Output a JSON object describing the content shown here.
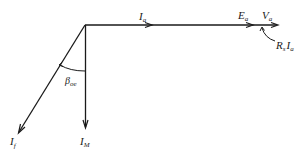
{
  "diagram": {
    "type": "phasor-diagram",
    "colors": {
      "ink": "#1a1a1a",
      "background": "#ffffff"
    },
    "phasors": [
      {
        "id": "Ia",
        "base": "I",
        "sub": "a",
        "direction": "horizontal-right"
      },
      {
        "id": "Ea",
        "base": "E",
        "sub": "a",
        "direction": "horizontal-right"
      },
      {
        "id": "Va",
        "base": "V",
        "sub": "a",
        "direction": "horizontal-right"
      },
      {
        "id": "RsIa",
        "base1": "R",
        "sub1": "s",
        "base2": "I",
        "sub2": "a",
        "direction": "voltage-drop"
      },
      {
        "id": "IM",
        "base": "I",
        "sub": "M",
        "direction": "vertical-down"
      },
      {
        "id": "If",
        "base": "I",
        "sub": "f",
        "direction": "diagonal-down-left"
      }
    ],
    "angle": {
      "base": "β",
      "sub": "oe"
    }
  }
}
